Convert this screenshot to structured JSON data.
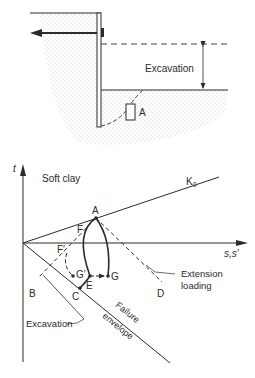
{
  "excavation_section": {
    "excavation_label": "Excavation",
    "element_label": "A"
  },
  "stress_path_plot": {
    "y_axis_label": "t",
    "x_axis_label": "s,s′",
    "material_label": "Soft clay",
    "k0_label": "K",
    "k0_subscript": "0",
    "point_labels": {
      "A": "A",
      "F": "F",
      "F_prime": "F′",
      "G_prime": "G′",
      "G": "G",
      "E": "E",
      "C": "C",
      "B": "B",
      "D": "D"
    },
    "extension_label_line1": "Extension",
    "extension_label_line2": "loading",
    "excavation_label": "Excavation",
    "failure_label_line1": "Failure",
    "failure_label_line2": "envelope"
  },
  "colors": {
    "line": "#2b2b2b",
    "soil_dots": "#9a9a9a",
    "background": "#ffffff"
  }
}
